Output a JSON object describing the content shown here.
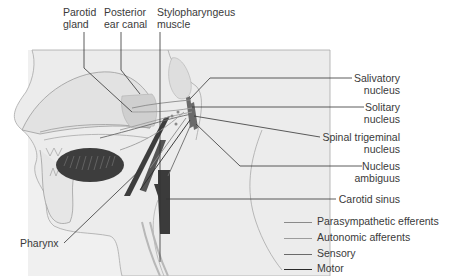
{
  "diagram": {
    "colors": {
      "background_panel": "#efefef",
      "head_fill": "#e4e4e4",
      "outline": "#9a9a9a",
      "parotid": "#cdcdcd",
      "dark_structure": "#3b3b3b",
      "leader_line": "#333333",
      "parasympathetic": "#8a8a8a",
      "autonomic": "#9c9c9c",
      "sensory": "#6a6a6a",
      "motor": "#2a2a2a"
    },
    "top_labels": [
      {
        "id": "parotid",
        "lines": [
          "Parotid",
          "gland"
        ]
      },
      {
        "id": "ear",
        "lines": [
          "Posterior",
          "ear canal"
        ]
      },
      {
        "id": "stylo",
        "lines": [
          "Stylopharyngeus",
          "muscle"
        ]
      }
    ],
    "right_labels": [
      {
        "id": "salivatory",
        "lines": [
          "Salivatory",
          "nucleus"
        ]
      },
      {
        "id": "solitary",
        "lines": [
          "Solitary",
          "nucleus"
        ]
      },
      {
        "id": "trigeminal",
        "lines": [
          "Spinal trigeminal",
          "nucleus"
        ]
      },
      {
        "id": "ambiguus",
        "lines": [
          "Nucleus",
          "ambiguus"
        ]
      },
      {
        "id": "carotid",
        "lines": [
          "Carotid sinus"
        ]
      }
    ],
    "left_labels": [
      {
        "id": "pharynx",
        "lines": [
          "Pharynx"
        ]
      }
    ],
    "legend": [
      {
        "label": "Parasympathetic efferents",
        "color": "#8a8a8a"
      },
      {
        "label": "Autonomic afferents",
        "color": "#9c9c9c"
      },
      {
        "label": "Sensory",
        "color": "#6a6a6a"
      },
      {
        "label": "Motor",
        "color": "#2a2a2a"
      }
    ]
  }
}
